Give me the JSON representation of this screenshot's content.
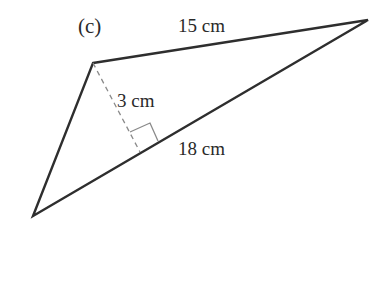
{
  "figure": {
    "label": "(c)",
    "shape": "triangle",
    "sides": {
      "top": "15 cm",
      "base": "18 cm"
    },
    "height": "3 cm",
    "colors": {
      "stroke": "#2e2e2e",
      "dashed": "#8a8a8a"
    }
  }
}
